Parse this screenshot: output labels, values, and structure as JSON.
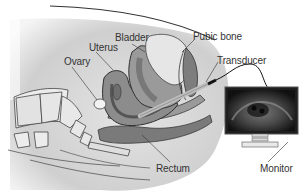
{
  "diagram": {
    "labels": {
      "bladder": "Bladder",
      "uterus": "Uterus",
      "ovary": "Ovary",
      "pubic_bone": "Pubic bone",
      "transducer": "Transducer",
      "rectum": "Rectum",
      "monitor": "Monitor"
    },
    "colors": {
      "body_fill": "#d4d4d4",
      "uterus_fill": "#8c8c8c",
      "uterus_inner": "#6e6e6e",
      "bladder_fill": "#e6e6e6",
      "bone_fill": "#ececec",
      "rectum_fill": "#7a7a7a",
      "outline": "#3a3a3a",
      "monitor_frame": "#222222",
      "monitor_screen": "#1a1a1a"
    }
  }
}
